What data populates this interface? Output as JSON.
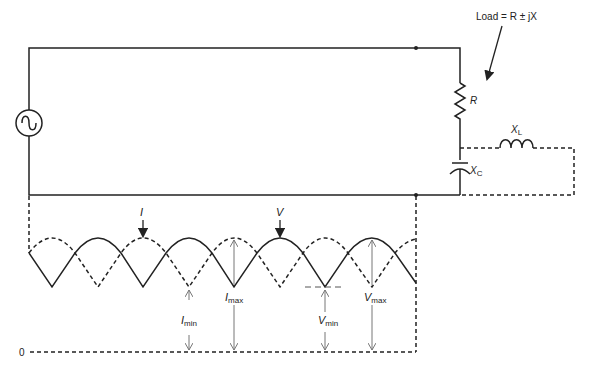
{
  "diagram": {
    "type": "transmission-line-standing-wave",
    "load_label": "Load = R ± jX",
    "components": {
      "source": {
        "symbol": "ac-source"
      },
      "resistor": {
        "label": "R"
      },
      "inductor": {
        "label": "X",
        "subscript": "L"
      },
      "capacitor": {
        "label": "X",
        "subscript": "C"
      }
    },
    "waveforms": {
      "current": {
        "label": "I",
        "style": "dashed"
      },
      "voltage": {
        "label": "V",
        "style": "solid"
      }
    },
    "measurements": {
      "i_min": {
        "label": "I",
        "subscript": "min"
      },
      "i_max": {
        "label": "I",
        "subscript": "max"
      },
      "v_min": {
        "label": "V",
        "subscript": "min"
      },
      "v_max": {
        "label": "V",
        "subscript": "max"
      }
    },
    "zero_label": "0",
    "colors": {
      "line": "#222222",
      "dimension": "#777777",
      "background": "#ffffff"
    }
  }
}
